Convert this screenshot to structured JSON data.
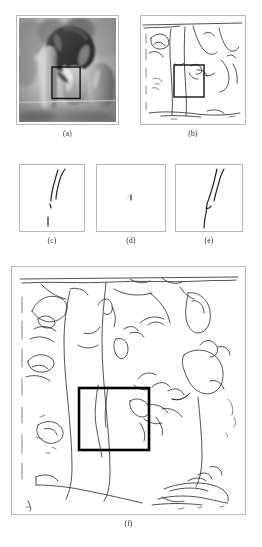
{
  "figure": {
    "kind": "multi-panel-figure",
    "panel_count": 6,
    "background_color": "#ffffff",
    "frame_color": "#b9b9b9",
    "ink_color": "#262626",
    "roi_color": "#000000"
  },
  "captions": {
    "a": "(a)",
    "b": "(b)",
    "c": "(c)",
    "d": "(d)",
    "e": "(e)",
    "f": "(f)"
  },
  "panels": [
    {
      "id": "a",
      "label": "(a)",
      "type": "grayscale-photograph",
      "content": "peppers test image",
      "has_roi_box": true,
      "roi": {
        "x": 0.34,
        "y": 0.47,
        "w": 0.29,
        "h": 0.3
      }
    },
    {
      "id": "b",
      "label": "(b)",
      "type": "edge-map",
      "content": "edge map of peppers image",
      "has_roi_box": true,
      "roi": {
        "x": 0.32,
        "y": 0.46,
        "w": 0.29,
        "h": 0.3
      }
    },
    {
      "id": "c",
      "label": "(c)",
      "type": "edge-detail-crop",
      "content": "two near-vertical edge curves with short isolated segment",
      "has_roi_box": false
    },
    {
      "id": "d",
      "label": "(d)",
      "type": "edge-detail-crop",
      "content": "nearly empty crop with single small mark",
      "has_roi_box": false
    },
    {
      "id": "e",
      "label": "(e)",
      "type": "edge-detail-crop",
      "content": "long continuous edge curve with shorter parallel curve",
      "has_roi_box": false
    },
    {
      "id": "f",
      "label": "(f)",
      "type": "edge-map-large",
      "content": "full-size edge map of peppers image with region of interest",
      "has_roi_box": true,
      "roi": {
        "x": 0.285,
        "y": 0.49,
        "w": 0.215,
        "h": 0.235
      }
    }
  ]
}
